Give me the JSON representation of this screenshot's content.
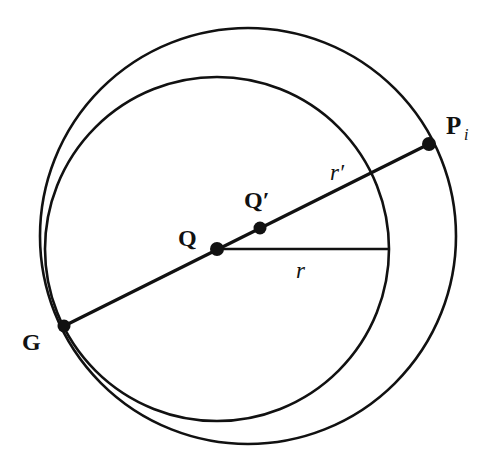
{
  "diagram": {
    "type": "geometry",
    "colors": {
      "stroke": "#111111",
      "background": "#ffffff"
    },
    "outer_circle": {
      "cx": 248,
      "cy": 236,
      "r": 208
    },
    "inner_circle": {
      "cx": 217,
      "cy": 249,
      "r": 172
    },
    "points": {
      "G": {
        "label": "G",
        "x": 64,
        "y": 326
      },
      "Q": {
        "label": "Q",
        "x": 217,
        "y": 249
      },
      "Q_prime": {
        "label": "Q′",
        "x": 260,
        "y": 228
      },
      "P_i": {
        "label": "P",
        "subscript": "i",
        "x": 429,
        "y": 144
      }
    },
    "segments": {
      "radius_r": {
        "label": "r"
      },
      "radius_r_prime": {
        "label": "r′"
      }
    }
  }
}
